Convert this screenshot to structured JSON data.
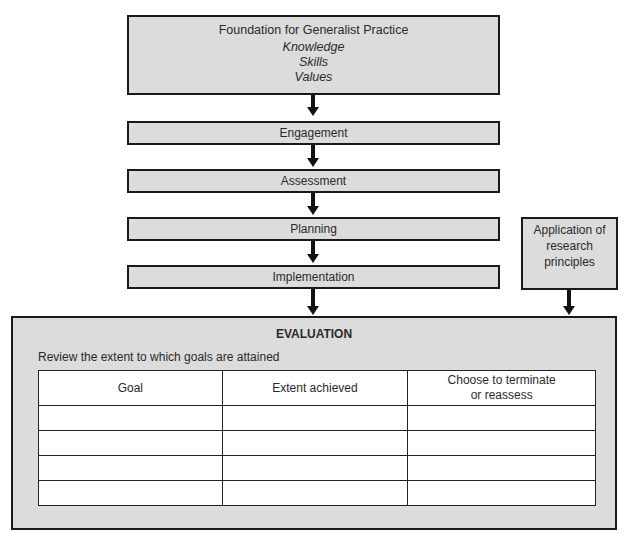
{
  "foundation": {
    "title": "Foundation for Generalist Practice",
    "items": [
      "Knowledge",
      "Skills",
      "Values"
    ]
  },
  "steps": [
    {
      "label": "Engagement"
    },
    {
      "label": "Assessment"
    },
    {
      "label": "Planning"
    },
    {
      "label": "Implementation"
    }
  ],
  "side_box": {
    "lines": [
      "Application of",
      "research",
      "principles"
    ]
  },
  "evaluation": {
    "title": "EVALUATION",
    "subtitle": "Review the extent to which goals are attained",
    "table": {
      "headers": [
        "Goal",
        "Extent achieved",
        "Choose to terminate",
        "or reassess"
      ],
      "rows": [
        [
          "",
          "",
          ""
        ],
        [
          "",
          "",
          ""
        ],
        [
          "",
          "",
          ""
        ],
        [
          "",
          "",
          ""
        ]
      ]
    }
  },
  "colors": {
    "box_fill": "#dcdcdc",
    "border": "#1a1a1a",
    "arrow": "#111111"
  }
}
